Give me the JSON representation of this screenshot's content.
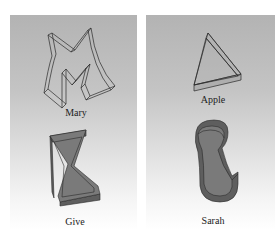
{
  "figures": [
    {
      "name": "Mary",
      "shape": "m-letter-extruded-outline",
      "position": "top-left"
    },
    {
      "name": "Apple",
      "shape": "triangle-extruded-outline",
      "position": "top-right"
    },
    {
      "name": "Give",
      "shape": "hourglass-extruded-solid",
      "position": "bottom-left"
    },
    {
      "name": "Sarah",
      "shape": "foot-extruded-solid",
      "position": "bottom-right"
    }
  ],
  "colors": {
    "panel_top": "#b3b3b3",
    "panel_bottom": "#ffffff",
    "solid_fill": "#7a7a7a",
    "solid_side": "#5e5e5e",
    "outline": "#2a2a2a"
  }
}
